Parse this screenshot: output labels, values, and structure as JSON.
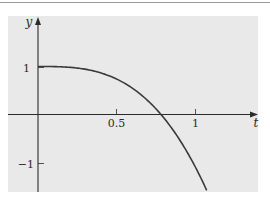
{
  "chart_data": {
    "type": "line",
    "title": "",
    "xlabel": "t",
    "ylabel": "y",
    "xlim": [
      -0.19,
      1.41
    ],
    "ylim": [
      -1.6,
      2.0
    ],
    "x_ticks": [
      {
        "value": 0.5,
        "label": "0.5"
      },
      {
        "value": 1,
        "label": "1"
      }
    ],
    "y_ticks": [
      {
        "value": 1,
        "label": "1"
      },
      {
        "value": -1,
        "label": "−1"
      }
    ],
    "grid": false,
    "legend": null,
    "series": [
      {
        "name": "y(t)",
        "x": [
          0,
          0.1,
          0.2,
          0.3,
          0.4,
          0.5,
          0.6,
          0.7,
          0.78,
          0.85,
          0.9,
          0.95,
          1.0,
          1.05,
          1.08
        ],
        "values": [
          1.0,
          1.0,
          0.98,
          0.94,
          0.87,
          0.8,
          0.66,
          0.46,
          0.0,
          -0.29,
          -0.53,
          -0.8,
          -1.1,
          -1.43,
          -1.62
        ]
      }
    ],
    "annotations": [
      "Curve starts at (0, 1) with zero slope",
      "Curve crosses the t-axis near t ≈ 0.78"
    ]
  },
  "labels": {
    "x_axis": "t",
    "y_axis": "y",
    "x_tick_05": "0.5",
    "x_tick_1": "1",
    "y_tick_1": "1",
    "y_tick_neg1": "−1"
  },
  "colors": {
    "panel_background": "#e9e9e9",
    "axis": "#2b2b2b",
    "curve": "#3a3a3a",
    "top_rule": "#9a9a9a"
  }
}
